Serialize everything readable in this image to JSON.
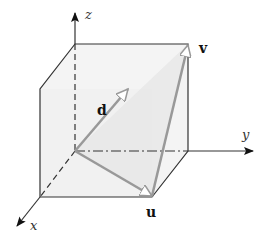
{
  "diagram": {
    "axes": {
      "x": {
        "label": "x"
      },
      "y": {
        "label": "y"
      },
      "z": {
        "label": "z"
      }
    },
    "vectors": [
      {
        "name": "d",
        "label": "d"
      },
      {
        "name": "u",
        "label": "u"
      },
      {
        "name": "v",
        "label": "v"
      }
    ],
    "colors": {
      "edge": "#333333",
      "vector": "#999999",
      "face": "#f2f2f2"
    }
  }
}
